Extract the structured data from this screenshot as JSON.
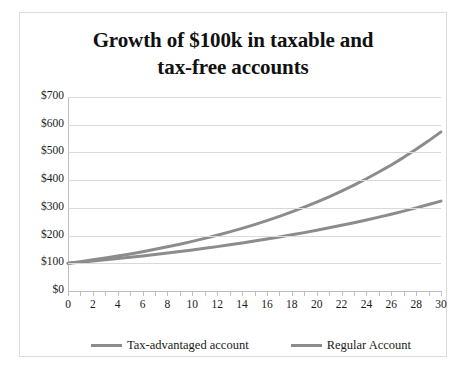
{
  "chart_data": {
    "type": "line",
    "title": "Growth of $100k in taxable and tax-free accounts",
    "title_line1": "Growth of $100k in taxable and",
    "title_line2": "tax-free accounts",
    "xlabel": "",
    "ylabel": "",
    "xlim": [
      0,
      30
    ],
    "ylim": [
      0,
      700
    ],
    "grid": true,
    "legend_position": "bottom",
    "y_ticks": [
      0,
      100,
      200,
      300,
      400,
      500,
      600,
      700
    ],
    "y_tick_labels": [
      "$0",
      "$100",
      "$200",
      "$300",
      "$400",
      "$500",
      "$600",
      "$700"
    ],
    "x_ticks": [
      0,
      1,
      2,
      3,
      4,
      5,
      6,
      7,
      8,
      9,
      10,
      11,
      12,
      13,
      14,
      15,
      16,
      17,
      18,
      19,
      20,
      21,
      22,
      23,
      24,
      25,
      26,
      27,
      28,
      29,
      30
    ],
    "x_tick_labels": [
      "0",
      "2",
      "4",
      "6",
      "8",
      "10",
      "12",
      "14",
      "16",
      "18",
      "20",
      "22",
      "24",
      "26",
      "28",
      "30"
    ],
    "x_labeled_values": [
      0,
      2,
      4,
      6,
      8,
      10,
      12,
      14,
      16,
      18,
      20,
      22,
      24,
      26,
      28,
      30
    ],
    "x": [
      0,
      1,
      2,
      3,
      4,
      5,
      6,
      7,
      8,
      9,
      10,
      11,
      12,
      13,
      14,
      15,
      16,
      17,
      18,
      19,
      20,
      21,
      22,
      23,
      24,
      25,
      26,
      27,
      28,
      29,
      30
    ],
    "series": [
      {
        "name": "Tax-advantaged account",
        "color": "#8c8c8c",
        "values": [
          100,
          106,
          112.4,
          119.1,
          126.2,
          133.8,
          141.9,
          150.4,
          159.4,
          168.9,
          179.1,
          189.8,
          201.2,
          213.3,
          226.1,
          239.7,
          254.0,
          269.3,
          285.4,
          302.6,
          320.7,
          339.9,
          360.4,
          382.0,
          404.9,
          429.2,
          454.9,
          482.2,
          511.1,
          541.8,
          574.3
        ]
      },
      {
        "name": "Regular Account",
        "color": "#8c8c8c",
        "values": [
          100,
          104,
          108.2,
          112.5,
          117.0,
          121.7,
          126.5,
          131.6,
          136.9,
          142.3,
          148.0,
          153.9,
          160.1,
          166.5,
          173.2,
          180.1,
          187.3,
          194.8,
          202.6,
          210.7,
          219.1,
          227.9,
          237.0,
          246.5,
          256.3,
          266.6,
          277.2,
          288.3,
          299.9,
          311.9,
          324.3
        ]
      }
    ]
  }
}
